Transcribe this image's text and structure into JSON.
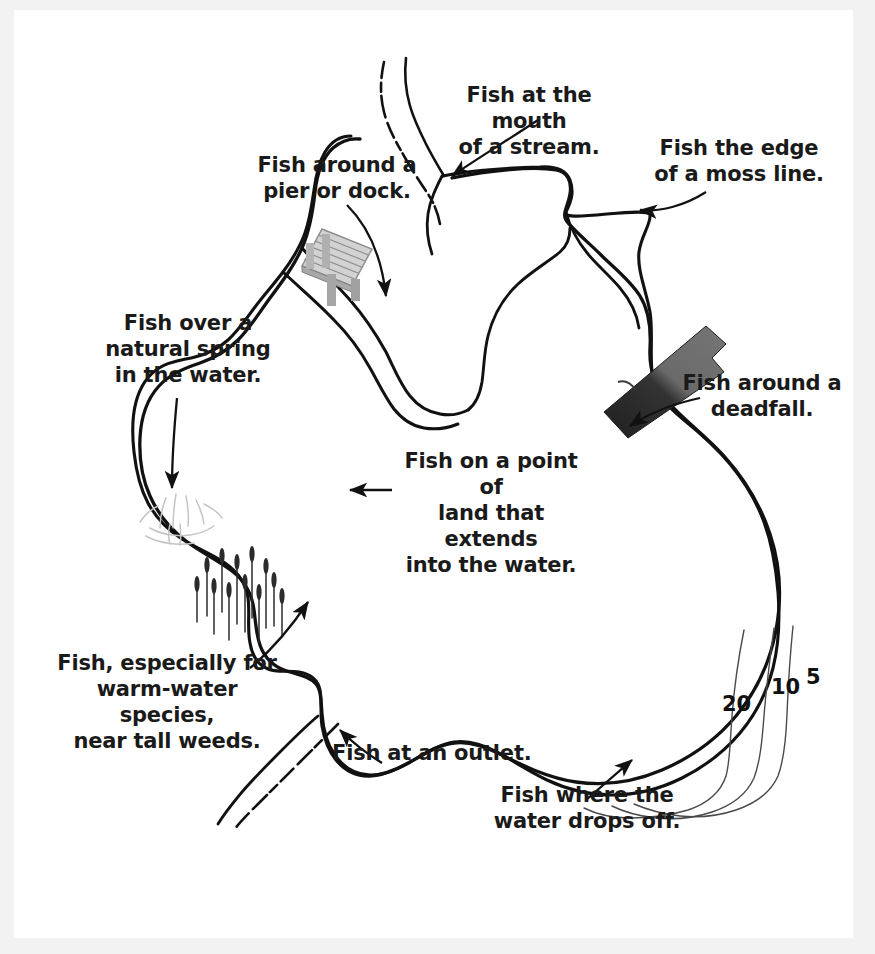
{
  "diagram": {
    "background_color": "#ffffff",
    "ink_color": "#111111",
    "shoreline_color": "#111111",
    "deadfall_color_dark": "#262626",
    "deadfall_color_light": "#6e6e6e",
    "pier_color": "#b7b7b7",
    "weed_color": "#2b2b2b",
    "spring_color": "#c9c9c9",
    "contour_color": "#4d4d4d"
  },
  "callouts": [
    {
      "id": "stream-mouth",
      "text": "Fish at the mouth\nof a stream.",
      "align": "center"
    },
    {
      "id": "pier-dock",
      "text": "Fish around a\npier or dock.",
      "align": "center"
    },
    {
      "id": "moss-line",
      "text": "Fish the edge\nof a moss line.",
      "align": "center"
    },
    {
      "id": "natural-spring",
      "text": "Fish over a\nnatural spring\nin the water.",
      "align": "center"
    },
    {
      "id": "deadfall",
      "text": "Fish around a\ndeadfall.",
      "align": "center"
    },
    {
      "id": "point-of-land",
      "text": "Fish on a point of\nland that extends\ninto the water.",
      "align": "center"
    },
    {
      "id": "tall-weeds",
      "text": "Fish, especially for\nwarm-water species,\nnear tall weeds.",
      "align": "center"
    },
    {
      "id": "outlet",
      "text": "Fish at an outlet.",
      "align": "left"
    },
    {
      "id": "drop-off",
      "text": "Fish where the\nwater drops off.",
      "align": "center"
    }
  ],
  "depth_contours": [
    {
      "id": "contour-20",
      "label": "20"
    },
    {
      "id": "contour-10",
      "label": "10"
    },
    {
      "id": "contour-5",
      "label": "5"
    }
  ],
  "features": [
    {
      "id": "inlet-stream",
      "name": "inlet stream"
    },
    {
      "id": "outlet-stream",
      "name": "outlet stream"
    },
    {
      "id": "pier",
      "name": "pier or dock"
    },
    {
      "id": "deadfall-log",
      "name": "deadfall log"
    },
    {
      "id": "spring-sketch",
      "name": "natural spring"
    },
    {
      "id": "weed-bed",
      "name": "tall weeds"
    },
    {
      "id": "point-of-land",
      "name": "point of land"
    },
    {
      "id": "moss-line",
      "name": "moss line"
    },
    {
      "id": "drop-off",
      "name": "drop off"
    }
  ]
}
